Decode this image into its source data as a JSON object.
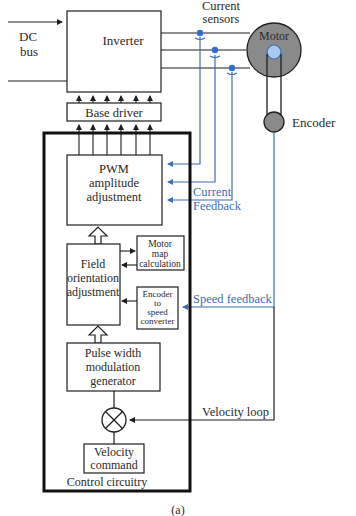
{
  "diagram": {
    "caption": "(a)",
    "colors": {
      "line": "#1e1e1e",
      "feedback": "#3b6fb6",
      "motor_fill": "#8a8a8a",
      "rotor_fill": "#a8c8ee",
      "sensor_dot": "#2f6fd0"
    },
    "dc_bus": {
      "line1": "DC",
      "line2": "bus"
    },
    "inverter": {
      "label": "Inverter"
    },
    "base_driver": {
      "label": "Base driver"
    },
    "current_sensors": {
      "line1": "Current",
      "line2": "sensors"
    },
    "motor": {
      "label": "Motor"
    },
    "encoder": {
      "label": "Encoder"
    },
    "pwm_block": {
      "line1": "PWM",
      "line2": "amplitude",
      "line3": "adjustment"
    },
    "current_feedback": {
      "line1": "Current",
      "line2": "Feedback"
    },
    "field_block": {
      "line1": "Field",
      "line2": "orientation",
      "line3": "adjustment"
    },
    "motor_map": {
      "line1": "Motor",
      "line2": "map",
      "line3": "calculation"
    },
    "encoder_converter": {
      "line1": "Encoder",
      "line2": "to",
      "line3": "speed",
      "line4": "converter"
    },
    "speed_feedback": {
      "label": "Speed feedback"
    },
    "pwm_generator": {
      "line1": "Pulse width",
      "line2": "modulation",
      "line3": "generator"
    },
    "velocity_loop": {
      "label": "Velocity loop"
    },
    "velocity_command": {
      "line1": "Velocity",
      "line2": "command"
    },
    "control_circuitry": {
      "label": "Control circuitry"
    }
  }
}
